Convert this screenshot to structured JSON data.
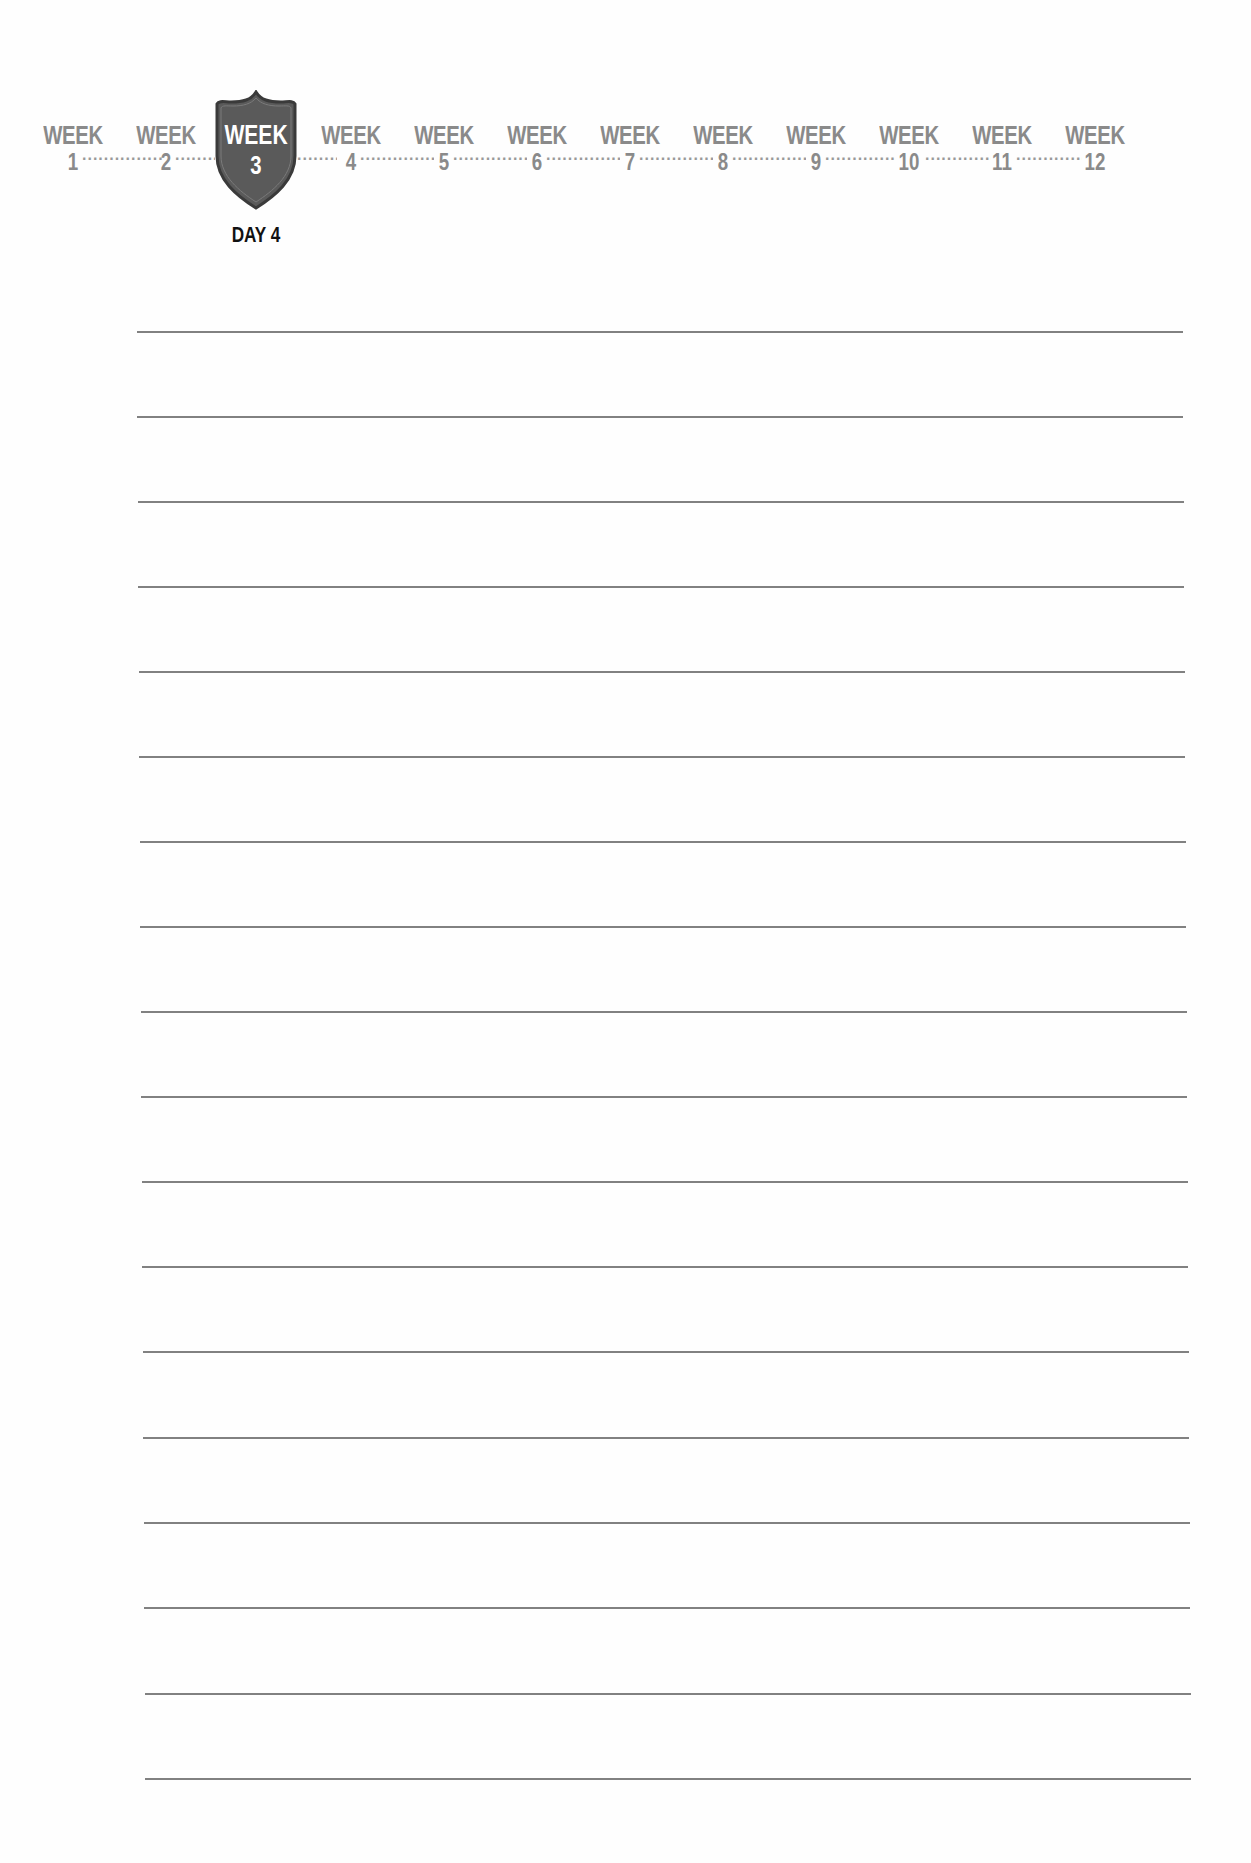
{
  "tracker": {
    "weeks": [
      {
        "label": "WEEK",
        "number": "1",
        "active": false
      },
      {
        "label": "WEEK",
        "number": "2",
        "active": false
      },
      {
        "label": "WEEK",
        "number": "3",
        "active": true
      },
      {
        "label": "WEEK",
        "number": "4",
        "active": false
      },
      {
        "label": "WEEK",
        "number": "5",
        "active": false
      },
      {
        "label": "WEEK",
        "number": "6",
        "active": false
      },
      {
        "label": "WEEK",
        "number": "7",
        "active": false
      },
      {
        "label": "WEEK",
        "number": "8",
        "active": false
      },
      {
        "label": "WEEK",
        "number": "9",
        "active": false
      },
      {
        "label": "WEEK",
        "number": "10",
        "active": false
      },
      {
        "label": "WEEK",
        "number": "11",
        "active": false
      },
      {
        "label": "WEEK",
        "number": "12",
        "active": false
      }
    ],
    "current_week": {
      "label": "WEEK",
      "number": "3"
    },
    "current_day": "DAY 4",
    "colors": {
      "inactive_text": "#8a8a8a",
      "shield_fill": "#5a5a5a",
      "shield_border": "#3a3a3a",
      "day_text": "#111111",
      "rule_line": "#6b6b6b"
    }
  },
  "ruled_lines": {
    "count": 18
  }
}
